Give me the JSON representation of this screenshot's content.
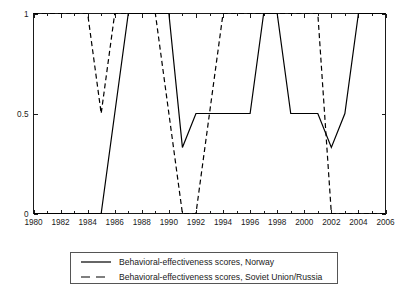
{
  "chart_data": {
    "type": "line",
    "title": "",
    "xlabel": "",
    "ylabel": "",
    "xlim": [
      1980,
      2006
    ],
    "ylim": [
      0,
      1
    ],
    "grid": false,
    "legend_position": "below-center",
    "xticks": [
      1980,
      1982,
      1984,
      1986,
      1988,
      1990,
      1992,
      1994,
      1996,
      1998,
      2000,
      2002,
      2004,
      2006
    ],
    "xtick_labels": [
      "1980",
      "1982",
      "1984",
      "1986",
      "1988",
      "1990",
      "1992",
      "1994",
      "1996",
      "1998",
      "2000",
      "2002",
      "2004",
      "2006"
    ],
    "xticks_minor": [
      1981,
      1983,
      1985,
      1987,
      1989,
      1991,
      1993,
      1995,
      1997,
      1999,
      2001,
      2003,
      2005
    ],
    "yticks": [
      0,
      0.5,
      1
    ],
    "ytick_labels": [
      "0",
      "0.5",
      "1"
    ],
    "series": [
      {
        "name": "Behavioral-effectiveness scores, Norway",
        "style": "solid",
        "color": "#000000",
        "x": [
          1980,
          1981,
          1982,
          1983,
          1984,
          1985,
          1986,
          1987,
          1988,
          1989,
          1990,
          1991,
          1992,
          1993,
          1994,
          1995,
          1996,
          1997,
          1998,
          1999,
          2000,
          2001,
          2002,
          2003,
          2004,
          2005,
          2006
        ],
        "values": [
          0,
          0,
          0,
          0,
          0,
          0,
          0.5,
          1,
          1,
          1,
          1,
          0.33,
          0.5,
          0.5,
          0.5,
          0.5,
          0.5,
          1,
          1,
          0.5,
          0.5,
          0.5,
          0.33,
          0.5,
          1,
          1,
          1
        ]
      },
      {
        "name": "Behavioral-effectiveness scores, Soviet Union/Russia",
        "style": "dashed",
        "color": "#000000",
        "x": [
          1980,
          1981,
          1982,
          1983,
          1984,
          1985,
          1986,
          1987,
          1988,
          1989,
          1990,
          1991,
          1992,
          1993,
          1994,
          1995,
          1996,
          1997,
          1998,
          1999,
          2000,
          2001,
          2002,
          2003,
          2004,
          2005,
          2006
        ],
        "values": [
          1,
          1,
          1,
          1,
          1,
          0.5,
          1,
          1,
          1,
          1,
          0.5,
          0,
          0,
          0.5,
          1,
          1,
          1,
          1,
          1,
          1,
          1,
          1,
          0,
          0,
          0,
          0,
          0
        ]
      }
    ]
  },
  "legend": {
    "entries": [
      {
        "label": "Behavioral-effectiveness scores, Norway",
        "style": "solid"
      },
      {
        "label": "Behavioral-effectiveness scores, Soviet Union/Russia",
        "style": "dashed"
      }
    ]
  }
}
